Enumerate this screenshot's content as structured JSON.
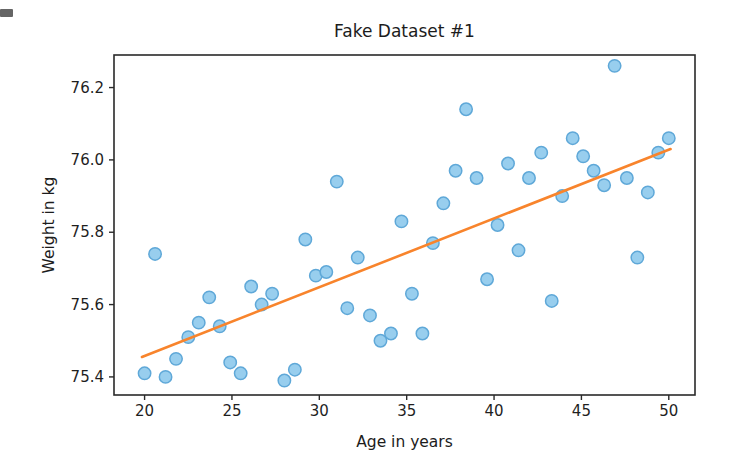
{
  "figure": {
    "title": "Fake Dataset #1",
    "xlabel": "Age in years",
    "ylabel": "Weight in kg"
  },
  "chart_data": {
    "type": "scatter",
    "title": "Fake Dataset #1",
    "xlabel": "Age in years",
    "ylabel": "Weight in kg",
    "xlim": [
      18.25,
      51.5
    ],
    "ylim": [
      75.35,
      76.29
    ],
    "x_ticks": [
      "20",
      "25",
      "30",
      "35",
      "40",
      "45",
      "50"
    ],
    "y_ticks": [
      "75.4",
      "75.6",
      "75.8",
      "76.0",
      "76.2"
    ],
    "grid": false,
    "legend": null,
    "series": [
      {
        "name": "weight-vs-age-points",
        "type": "scatter",
        "marker_fill": "#92cbed",
        "marker_edge": "#5fa8d8",
        "marker_radius": 6.2,
        "points": [
          [
            20.0,
            75.41
          ],
          [
            20.6,
            75.74
          ],
          [
            21.2,
            75.4
          ],
          [
            21.8,
            75.45
          ],
          [
            22.5,
            75.51
          ],
          [
            23.1,
            75.55
          ],
          [
            23.7,
            75.62
          ],
          [
            24.3,
            75.54
          ],
          [
            24.9,
            75.44
          ],
          [
            25.5,
            75.41
          ],
          [
            26.1,
            75.65
          ],
          [
            26.7,
            75.6
          ],
          [
            27.3,
            75.63
          ],
          [
            28.0,
            75.39
          ],
          [
            28.6,
            75.42
          ],
          [
            29.2,
            75.78
          ],
          [
            29.8,
            75.68
          ],
          [
            30.4,
            75.69
          ],
          [
            31.0,
            75.94
          ],
          [
            31.6,
            75.59
          ],
          [
            32.2,
            75.73
          ],
          [
            32.9,
            75.57
          ],
          [
            33.5,
            75.5
          ],
          [
            34.1,
            75.52
          ],
          [
            34.7,
            75.83
          ],
          [
            35.3,
            75.63
          ],
          [
            35.9,
            75.52
          ],
          [
            36.5,
            75.77
          ],
          [
            37.1,
            75.88
          ],
          [
            37.8,
            75.97
          ],
          [
            38.4,
            76.14
          ],
          [
            39.0,
            75.95
          ],
          [
            39.6,
            75.67
          ],
          [
            40.2,
            75.82
          ],
          [
            40.8,
            75.99
          ],
          [
            41.4,
            75.75
          ],
          [
            42.0,
            75.95
          ],
          [
            42.7,
            76.02
          ],
          [
            43.3,
            75.61
          ],
          [
            43.9,
            75.9
          ],
          [
            44.5,
            76.06
          ],
          [
            45.1,
            76.01
          ],
          [
            45.7,
            75.97
          ],
          [
            46.3,
            75.93
          ],
          [
            46.9,
            76.26
          ],
          [
            47.6,
            75.95
          ],
          [
            48.2,
            75.73
          ],
          [
            48.8,
            75.91
          ],
          [
            49.4,
            76.02
          ],
          [
            50.0,
            76.06
          ]
        ]
      },
      {
        "name": "trend-line",
        "type": "line",
        "color": "#f8842c",
        "width": 2.6,
        "points": [
          [
            19.85,
            75.455
          ],
          [
            50.1,
            76.03
          ]
        ]
      }
    ]
  },
  "style": {
    "axis_color": "#2a2a2a",
    "tick_label_color": "#1f1f1f",
    "background": "#ffffff"
  }
}
